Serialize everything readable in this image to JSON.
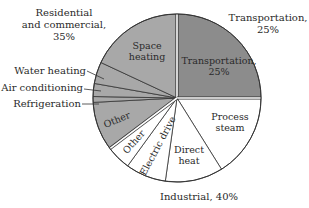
{
  "chart_data": {
    "type": "pie",
    "title": "",
    "center": [
      177,
      98
    ],
    "radius": 84,
    "start_angle_deg_clockwise_from_top": 0,
    "groups": [
      {
        "name": "Transportation",
        "label": "Transportation,",
        "percent_label": "25%",
        "value": 25,
        "color": "#8c8c8c",
        "label_pos": [
          268,
          20
        ],
        "slices": [
          {
            "name": "Transportation",
            "label_lines": [
              "Transportation,",
              "25%"
            ],
            "start": 0,
            "end": 90,
            "label_pos": [
              219,
              66
            ],
            "rotate": 0
          }
        ]
      },
      {
        "name": "Industrial",
        "label": "Industrial,",
        "percent_label": "40%",
        "value": 40,
        "color": "#ffffff",
        "label_pos": [
          199,
          200
        ],
        "slices": [
          {
            "name": "Process steam",
            "label_lines": [
              "Process",
              "steam"
            ],
            "start": 90,
            "end": 148,
            "label_pos": [
              230,
              122
            ],
            "rotate": 0
          },
          {
            "name": "Direct heat",
            "label_lines": [
              "Direct",
              "heat"
            ],
            "start": 148,
            "end": 188,
            "label_pos": [
              189,
              155
            ],
            "rotate": 0
          },
          {
            "name": "Electric drive",
            "label_lines": [
              "Electric drive"
            ],
            "start": 188,
            "end": 216,
            "label_pos": [
              158,
              146
            ],
            "rotate": -62
          },
          {
            "name": "Other",
            "label_lines": [
              "Other"
            ],
            "start": 216,
            "end": 233,
            "label_pos": [
              134,
              142
            ],
            "rotate": -48
          }
        ]
      },
      {
        "name": "Residential and commercial",
        "label_lines": [
          "Residential",
          "and commercial,",
          "35%"
        ],
        "value": 35,
        "color": "#a8a8a8",
        "label_pos": [
          64,
          16
        ],
        "slices": [
          {
            "name": "Other",
            "label_lines": [
              "Other"
            ],
            "start": 233,
            "end": 267,
            "label_pos": [
              117,
              120
            ],
            "rotate": -22
          },
          {
            "name": "Refrigeration",
            "label_lines": [],
            "start": 267,
            "end": 271,
            "callout": {
              "text": "Refrigeration",
              "text_pos": [
                81,
                107
              ],
              "line": [
                [
                  82,
                  104
                ],
                [
                  99,
                  104
                ]
              ]
            }
          },
          {
            "name": "Air conditioning",
            "label_lines": [],
            "start": 271,
            "end": 280,
            "callout": {
              "text": "Air conditioning",
              "text_pos": [
                83,
                91
              ],
              "line": [
                [
                  84,
                  89
                ],
                [
                  101,
                  91
                ]
              ]
            }
          },
          {
            "name": "Water heating",
            "label_lines": [],
            "start": 280,
            "end": 295,
            "callout": {
              "text": "Water heating",
              "text_pos": [
                86,
                74
              ],
              "line": [
                [
                  87,
                  71
                ],
                [
                  104,
                  79
                ]
              ]
            }
          },
          {
            "name": "Space heating",
            "label_lines": [
              "Space",
              "heating"
            ],
            "start": 295,
            "end": 360,
            "label_pos": [
              147,
              51
            ],
            "rotate": 0
          }
        ]
      }
    ],
    "values_percent": {
      "Transportation": 25,
      "Industrial": 40,
      "Residential and commercial": 35
    },
    "legend": "none"
  }
}
